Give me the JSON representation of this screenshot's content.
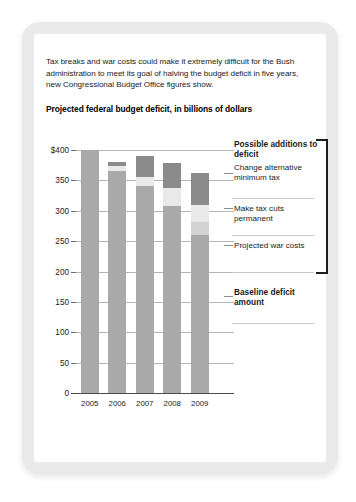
{
  "card": {
    "lede": "Tax breaks and war costs could make it extremely difficult for the Bush administration to meet its goal of halving the budget deficit in five years, new Congressional Budget Office figures show.",
    "chart_title": "Projected federal budget deficit, in billions of dollars"
  },
  "annotations": {
    "heading": "Possible additions to deficit",
    "item_amt": "Change alternative minimum tax",
    "item_tax": "Make tax cuts permanent",
    "item_war": "Projected war costs",
    "baseline": "Baseline deficit amount"
  },
  "chart_data": {
    "type": "bar",
    "subtype": "stacked",
    "title": "Projected federal budget deficit, in billions of dollars",
    "xlabel": "",
    "ylabel": "billions of dollars",
    "ylim": [
      0,
      400
    ],
    "yticks": [
      0,
      50,
      100,
      150,
      200,
      250,
      300,
      350,
      400
    ],
    "ytick_labels": [
      "0",
      "50",
      "100",
      "150",
      "200",
      "250",
      "300",
      "350",
      "$400"
    ],
    "grid": true,
    "legend_position": "right",
    "categories": [
      "2005",
      "2006",
      "2007",
      "2008",
      "2009"
    ],
    "series": [
      {
        "name": "Baseline deficit amount",
        "color": "#a9a9a9",
        "values": [
          400,
          365,
          340,
          307,
          260
        ]
      },
      {
        "name": "Projected war costs",
        "color": "#d3d3d3",
        "values": [
          0,
          0,
          0,
          0,
          22
        ]
      },
      {
        "name": "Make tax cuts permanent",
        "color": "#e9e9e9",
        "values": [
          0,
          9,
          16,
          31,
          28
        ]
      },
      {
        "name": "Change alternative minimum tax",
        "color": "#8b8b8b",
        "values": [
          0,
          7,
          34,
          40,
          52
        ]
      }
    ],
    "totals": [
      400,
      381,
      390,
      378,
      362
    ]
  },
  "colors": {
    "frame": "#e9e9e9",
    "bar_base": "#a9a9a9",
    "bar_war": "#d3d3d3",
    "bar_taxcuts": "#e9e9e9",
    "bar_amt": "#8b8b8b",
    "grid": "#b5b5b5",
    "axis": "#4a4a4a",
    "text": "#1b1b1b"
  }
}
